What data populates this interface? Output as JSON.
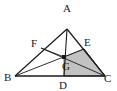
{
  "figure": {
    "background_color": "#ffffff",
    "stroke_color": "#1a1a1a",
    "shade_color": "#c2c2c2",
    "shade_stroke": "#4a4a4a",
    "points": {
      "A": {
        "label": "A",
        "x": 67,
        "y": 29,
        "label_x": 63,
        "label_y": 12
      },
      "B": {
        "label": "B",
        "x": 15,
        "y": 76,
        "label_x": 5,
        "label_y": 81
      },
      "C": {
        "label": "C",
        "x": 105,
        "y": 76,
        "label_x": 105,
        "label_y": 82
      },
      "D": {
        "label": "D",
        "x": 64,
        "y": 76,
        "label_x": 60,
        "label_y": 90
      },
      "E": {
        "label": "E",
        "x": 84,
        "y": 49,
        "label_x": 85,
        "label_y": 47
      },
      "F": {
        "label": "F",
        "x": 41,
        "y": 48,
        "label_x": 32,
        "label_y": 47
      },
      "G": {
        "label": "G",
        "x": 64,
        "y": 57,
        "label_x": 63,
        "label_y": 70
      }
    },
    "segments": [
      {
        "name": "side-AB",
        "from": "A",
        "to": "B"
      },
      {
        "name": "side-AC",
        "from": "A",
        "to": "C"
      },
      {
        "name": "side-BC",
        "from": "B",
        "to": "C"
      },
      {
        "name": "cevian-AD",
        "from": "A",
        "to": "D"
      },
      {
        "name": "cevian-BE",
        "from": "B",
        "to": "E"
      },
      {
        "name": "segment-FC",
        "from": "F",
        "to": "C"
      },
      {
        "name": "segment-FG",
        "from": "F",
        "to": "G"
      }
    ],
    "shaded_region": {
      "name": "quadrilateral-GECD",
      "vertices": [
        "G",
        "E",
        "C",
        "D"
      ]
    }
  }
}
